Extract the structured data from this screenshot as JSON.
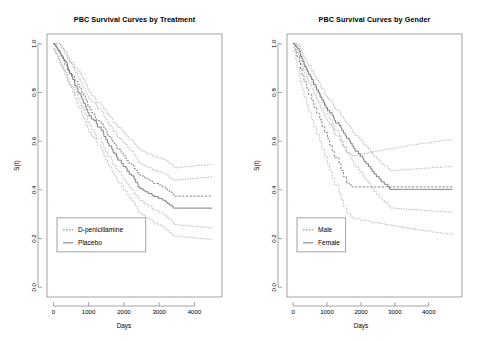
{
  "figure": {
    "width": 480,
    "height": 341,
    "background": "#ffffff",
    "line_color": "#6b6b6b",
    "ci_color": "#9a9a9a",
    "axis_color": "#8c8c8c"
  },
  "chart_data": [
    {
      "type": "line",
      "title": "PBC Survival Curves by Treatment",
      "xlabel": "Days",
      "ylabel": "S(t)",
      "xlim": [
        -180,
        4780
      ],
      "ylim": [
        -0.04,
        1.04
      ],
      "xticks": [
        0,
        1000,
        2000,
        3000,
        4000
      ],
      "xticklabels": [
        "0",
        "1000",
        "2000",
        "3000",
        "4000"
      ],
      "yticks": [
        0.0,
        0.2,
        0.4,
        0.6,
        0.8,
        1.0
      ],
      "yticklabels": [
        "0.0",
        "0.2",
        "0.4",
        "0.6",
        "0.8",
        "1.0"
      ],
      "grid": false,
      "legend_position": "bottom-left",
      "legend": [
        {
          "label": "D-penicillamine",
          "style": "dashed"
        },
        {
          "label": "Placebo",
          "style": "solid"
        }
      ],
      "series": [
        {
          "name": "D-penicillamine",
          "style": "dashed",
          "band": "confidence-interval-95",
          "x": [
            0,
            41,
            77,
            110,
            131,
            140,
            179,
            191,
            216,
            223,
            264,
            304,
            321,
            326,
            388,
            400,
            460,
            533,
            597,
            611,
            694,
            750,
            786,
            799,
            855,
            904,
            930,
            971,
            980,
            1037,
            1077,
            1152,
            1191,
            1217,
            1356,
            1413,
            1434,
            1487,
            1536,
            1576,
            1657,
            1690,
            1741,
            1786,
            1827,
            1925,
            1978,
            2055,
            2090,
            2151,
            2224,
            2288,
            2332,
            2386,
            2400,
            2456,
            2540,
            2598,
            2689,
            2796,
            2847,
            2976,
            3086,
            3170,
            3222,
            3282,
            3358,
            3395,
            3428,
            3445,
            3574,
            3611,
            3672,
            3762,
            3839,
            3853,
            3933,
            4079,
            4191,
            4365,
            4500
          ],
          "y": [
            1.0,
            0.994,
            0.988,
            0.982,
            0.976,
            0.97,
            0.964,
            0.958,
            0.951,
            0.945,
            0.939,
            0.927,
            0.921,
            0.914,
            0.902,
            0.89,
            0.877,
            0.871,
            0.858,
            0.846,
            0.833,
            0.82,
            0.814,
            0.801,
            0.788,
            0.775,
            0.769,
            0.756,
            0.743,
            0.73,
            0.717,
            0.71,
            0.697,
            0.684,
            0.671,
            0.664,
            0.651,
            0.638,
            0.625,
            0.618,
            0.605,
            0.592,
            0.585,
            0.572,
            0.566,
            0.553,
            0.54,
            0.527,
            0.52,
            0.507,
            0.5,
            0.487,
            0.48,
            0.474,
            0.467,
            0.46,
            0.453,
            0.446,
            0.44,
            0.433,
            0.426,
            0.42,
            0.413,
            0.407,
            0.4,
            0.394,
            0.387,
            0.38,
            0.374,
            0.374,
            0.374,
            0.374,
            0.374,
            0.374,
            0.374,
            0.374,
            0.374,
            0.374,
            0.374,
            0.374,
            0.374
          ]
        },
        {
          "name": "Placebo",
          "style": "solid",
          "band": "confidence-interval-95",
          "x": [
            0,
            51,
            71,
            105,
            128,
            186,
            207,
            216,
            264,
            288,
            304,
            348,
            388,
            400,
            427,
            460,
            515,
            549,
            597,
            611,
            674,
            694,
            730,
            786,
            815,
            850,
            904,
            930,
            975,
            1012,
            1077,
            1152,
            1217,
            1250,
            1356,
            1413,
            1434,
            1487,
            1536,
            1576,
            1657,
            1690,
            1741,
            1786,
            1827,
            1925,
            1978,
            2055,
            2090,
            2151,
            2224,
            2288,
            2332,
            2386,
            2400,
            2456,
            2540,
            2598,
            2689,
            2796,
            2847,
            2976,
            3086,
            3170,
            3222,
            3282,
            3358,
            3395,
            3428,
            3445,
            3574,
            3611,
            3672,
            3762,
            3839,
            3853,
            3933,
            4079,
            4191,
            4365,
            4500
          ],
          "y": [
            1.0,
            0.993,
            0.987,
            0.98,
            0.973,
            0.966,
            0.96,
            0.953,
            0.946,
            0.939,
            0.932,
            0.925,
            0.918,
            0.905,
            0.892,
            0.879,
            0.866,
            0.853,
            0.84,
            0.827,
            0.814,
            0.801,
            0.795,
            0.782,
            0.769,
            0.756,
            0.743,
            0.73,
            0.717,
            0.704,
            0.691,
            0.684,
            0.671,
            0.658,
            0.645,
            0.632,
            0.619,
            0.606,
            0.593,
            0.58,
            0.567,
            0.554,
            0.548,
            0.535,
            0.522,
            0.509,
            0.496,
            0.49,
            0.477,
            0.464,
            0.457,
            0.444,
            0.431,
            0.425,
            0.412,
            0.405,
            0.398,
            0.392,
            0.385,
            0.378,
            0.372,
            0.365,
            0.358,
            0.352,
            0.345,
            0.338,
            0.332,
            0.325,
            0.325,
            0.325,
            0.325,
            0.325,
            0.325,
            0.325,
            0.325,
            0.325,
            0.325,
            0.325,
            0.325,
            0.325,
            0.325
          ]
        }
      ]
    },
    {
      "type": "line",
      "title": "PBC Survival Curves by Gender",
      "xlabel": "Days",
      "ylabel": "S(t)",
      "xlim": [
        -180,
        4980
      ],
      "ylim": [
        -0.04,
        1.04
      ],
      "xticks": [
        0,
        1000,
        2000,
        3000,
        4000
      ],
      "xticklabels": [
        "0",
        "1000",
        "2000",
        "3000",
        "4000"
      ],
      "yticks": [
        0.0,
        0.2,
        0.4,
        0.6,
        0.8,
        1.0
      ],
      "yticklabels": [
        "0.0",
        "0.2",
        "0.4",
        "0.6",
        "0.8",
        "1.0"
      ],
      "grid": false,
      "legend_position": "bottom-left",
      "legend": [
        {
          "label": "Male",
          "style": "dashed"
        },
        {
          "label": "Female",
          "style": "solid"
        }
      ],
      "series": [
        {
          "name": "Male",
          "style": "dashed",
          "band": "confidence-interval-95",
          "x": [
            0,
            77,
            110,
            186,
            216,
            264,
            321,
            400,
            460,
            549,
            611,
            694,
            786,
            850,
            930,
            1012,
            1077,
            1152,
            1217,
            1356,
            1413,
            1487,
            1576,
            1690,
            1741,
            1827,
            1978,
            2055,
            2224,
            2332,
            2400,
            2540,
            2689,
            2796,
            2976,
            3086,
            3222,
            3358,
            3428,
            3574,
            3672,
            3762,
            3853,
            4079,
            4191,
            4365,
            4500,
            4700
          ],
          "y": [
            1.0,
            0.974,
            0.948,
            0.922,
            0.896,
            0.87,
            0.844,
            0.818,
            0.792,
            0.766,
            0.74,
            0.714,
            0.688,
            0.662,
            0.636,
            0.61,
            0.584,
            0.558,
            0.532,
            0.506,
            0.48,
            0.454,
            0.428,
            0.42,
            0.412,
            0.412,
            0.412,
            0.412,
            0.412,
            0.412,
            0.412,
            0.412,
            0.412,
            0.412,
            0.412,
            0.412,
            0.412,
            0.412,
            0.412,
            0.412,
            0.412,
            0.412,
            0.412,
            0.412,
            0.412,
            0.412,
            0.412,
            0.412
          ]
        },
        {
          "name": "Female",
          "style": "solid",
          "band": "confidence-interval-95",
          "x": [
            0,
            41,
            71,
            105,
            131,
            179,
            207,
            223,
            264,
            288,
            321,
            348,
            388,
            427,
            460,
            515,
            549,
            597,
            611,
            674,
            694,
            750,
            786,
            815,
            855,
            904,
            930,
            971,
            1012,
            1077,
            1152,
            1191,
            1217,
            1250,
            1356,
            1413,
            1434,
            1487,
            1536,
            1576,
            1657,
            1690,
            1741,
            1786,
            1827,
            1925,
            1978,
            2055,
            2090,
            2151,
            2224,
            2288,
            2332,
            2386,
            2456,
            2540,
            2598,
            2689,
            2796,
            2847,
            2976,
            3086,
            3170,
            3222,
            3282,
            3358,
            3395,
            3428,
            3574,
            3611,
            3672,
            3762,
            3839,
            3933,
            4079,
            4191,
            4365,
            4500,
            4700
          ],
          "y": [
            1.0,
            0.995,
            0.99,
            0.985,
            0.979,
            0.969,
            0.958,
            0.948,
            0.937,
            0.927,
            0.916,
            0.906,
            0.895,
            0.885,
            0.874,
            0.864,
            0.853,
            0.843,
            0.832,
            0.822,
            0.811,
            0.801,
            0.79,
            0.78,
            0.769,
            0.759,
            0.748,
            0.738,
            0.727,
            0.717,
            0.706,
            0.696,
            0.685,
            0.675,
            0.664,
            0.654,
            0.643,
            0.633,
            0.622,
            0.612,
            0.601,
            0.591,
            0.58,
            0.57,
            0.559,
            0.549,
            0.538,
            0.528,
            0.517,
            0.507,
            0.496,
            0.486,
            0.475,
            0.465,
            0.454,
            0.444,
            0.433,
            0.423,
            0.412,
            0.402,
            0.402,
            0.402,
            0.402,
            0.402,
            0.402,
            0.402,
            0.402,
            0.402,
            0.402,
            0.402,
            0.402,
            0.402,
            0.402,
            0.402,
            0.402,
            0.402,
            0.402,
            0.402,
            0.402
          ]
        }
      ]
    }
  ]
}
